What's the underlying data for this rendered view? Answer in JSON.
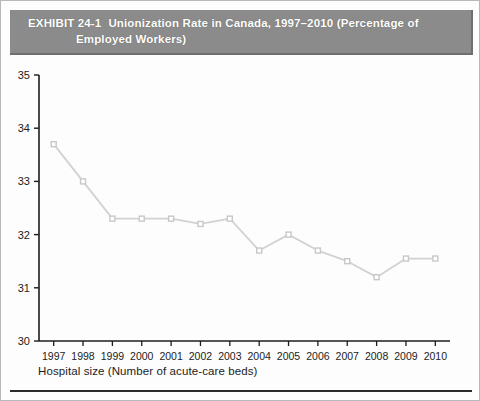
{
  "figure": {
    "exhibit_label": "EXHIBIT 24-1",
    "title_line1": "Unionization Rate in Canada, 1997–2010 (Percentage of",
    "title_line2": "Employed Workers)",
    "band_color": "#8b8b8b",
    "band_text_color": "#ffffff",
    "x_caption": "Hospital size (Number of acute-care beds)"
  },
  "chart_data": {
    "type": "line",
    "xlabel": "Hospital size (Number of acute-care beds)",
    "ylabel": "",
    "categories": [
      "1997",
      "1998",
      "1999",
      "2000",
      "2001",
      "2002",
      "2003",
      "2004",
      "2005",
      "2006",
      "2007",
      "2008",
      "2009",
      "2010"
    ],
    "values": [
      33.7,
      33.0,
      32.3,
      32.3,
      32.3,
      32.2,
      32.3,
      31.7,
      32.0,
      31.7,
      31.5,
      31.2,
      31.55,
      31.55
    ],
    "ylim": [
      30,
      35
    ],
    "ytick_labels": [
      "30",
      "31",
      "32",
      "33",
      "34",
      "35"
    ],
    "ytick_values": [
      30,
      31,
      32,
      33,
      34,
      35
    ],
    "xtick_labels": [
      "1997",
      "1998",
      "1999",
      "2000",
      "2001",
      "2002",
      "2003",
      "2004",
      "2005",
      "2006",
      "2007",
      "2008",
      "2009",
      "2010"
    ],
    "grid": false,
    "legend": null,
    "series_color": "#d2d2d2",
    "marker": "open-square",
    "marker_color": "#ffffff",
    "marker_edge_color": "#c8c8c8",
    "axis_color": "#1c1c1c"
  }
}
